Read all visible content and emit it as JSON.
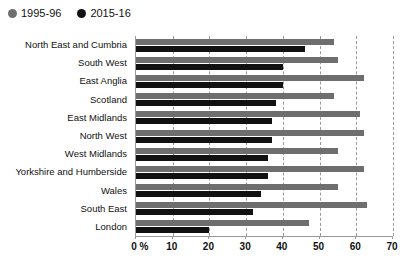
{
  "chart_data": {
    "type": "bar",
    "orientation": "horizontal",
    "title": "",
    "subtitle": "",
    "xlabel": "%",
    "ylabel": "",
    "xlim": [
      0,
      70
    ],
    "xticks": [
      0,
      10,
      20,
      30,
      40,
      50,
      60,
      70
    ],
    "xtick_labels": [
      "0 %",
      "10",
      "20",
      "30",
      "40",
      "50",
      "60",
      "70"
    ],
    "grid": true,
    "legend_position": "top-left",
    "categories": [
      "North East and Cumbria",
      "South West",
      "East Anglia",
      "Scotland",
      "East Midlands",
      "North West",
      "West Midlands",
      "Yorkshire and Humberside",
      "Wales",
      "South East",
      "London"
    ],
    "series": [
      {
        "name": "1995-96",
        "color": "#6e6e6e",
        "values": [
          54,
          55,
          62,
          54,
          61,
          62,
          55,
          62,
          55,
          63,
          47
        ]
      },
      {
        "name": "2015-16",
        "color": "#111111",
        "values": [
          46,
          40,
          40,
          38,
          37,
          37,
          36,
          36,
          34,
          32,
          20
        ]
      }
    ]
  },
  "legend": {
    "items": [
      {
        "label": "1995-96",
        "color": "#6e6e6e",
        "marker": "circle-marker"
      },
      {
        "label": "2015-16",
        "color": "#111111",
        "marker": "circle-marker"
      }
    ]
  }
}
